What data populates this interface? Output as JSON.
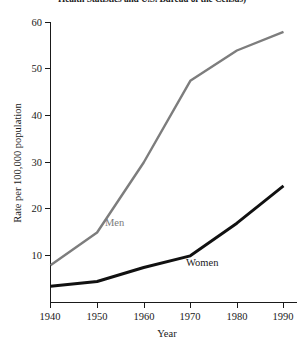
{
  "source_note": "Health Statistics and U.S. Bureau of the Census)",
  "axis": {
    "ylabel": "Rate per 100,000 population",
    "xlabel": "Year",
    "yticks": [
      "10",
      "20",
      "30",
      "40",
      "50",
      "60"
    ],
    "xticks": [
      "1940",
      "1950",
      "1960",
      "1970",
      "1980",
      "1990"
    ]
  },
  "labels": {
    "men": "Men",
    "women": "Women"
  },
  "colors": {
    "men_line": "#7d7d7d",
    "women_line": "#111111",
    "axis": "#1a1a1a",
    "background": "#ffffff"
  },
  "chart_data": {
    "type": "line",
    "title": "",
    "subtitle": "",
    "xlabel": "Year",
    "ylabel": "Rate per 100,000 population",
    "x": [
      1940,
      1950,
      1960,
      1970,
      1980,
      1990
    ],
    "xlim": [
      1940,
      1992
    ],
    "ylim": [
      0,
      60
    ],
    "yticks": [
      10,
      20,
      30,
      40,
      50,
      60
    ],
    "xticks": [
      1940,
      1950,
      1960,
      1970,
      1980,
      1990
    ],
    "grid": false,
    "legend": "inline-annotations",
    "series": [
      {
        "name": "Men",
        "color": "#7d7d7d",
        "values": [
          8,
          15,
          30,
          47.5,
          54,
          58
        ]
      },
      {
        "name": "Women",
        "color": "#111111",
        "values": [
          3.5,
          4.5,
          7.5,
          10,
          17,
          25
        ]
      }
    ],
    "annotations": [
      {
        "text": "Men",
        "x": 1951.5,
        "y": 20.5
      },
      {
        "text": "Women",
        "x": 1968.5,
        "y": 11.5
      }
    ]
  }
}
